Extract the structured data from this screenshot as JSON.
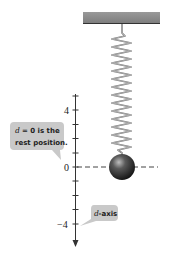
{
  "figure": {
    "ceiling": {
      "color": "#8a8a8a",
      "edge_color": "#333333"
    },
    "spring": {
      "coils": 14,
      "color": "#777777"
    },
    "mass": {
      "shape": "sphere",
      "color": "#2b2b2b"
    },
    "axis": {
      "name": "d-axis",
      "tick_labels": [
        {
          "value": 4,
          "label": "4"
        },
        {
          "value": 0,
          "label": "0"
        },
        {
          "value": -4,
          "label": "−4"
        }
      ],
      "tick_values": [
        5,
        4,
        3,
        2,
        1,
        0,
        -1,
        -2,
        -3,
        -4,
        -5
      ],
      "direction": "positive up, arrow pointing down"
    },
    "rest_line": {
      "style": "dashed",
      "at_value": 0
    },
    "callouts": {
      "rest_position": {
        "line1_var": "d",
        "line1_rest": " = 0 is the",
        "line2": "rest position."
      },
      "axis_label": {
        "var": "d",
        "rest": "-axis"
      }
    },
    "callout_color": "#c8c8c8"
  }
}
